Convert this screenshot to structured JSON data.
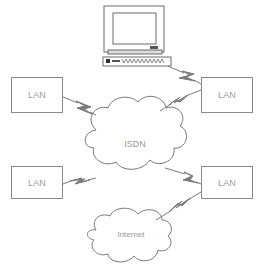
{
  "diagram": {
    "type": "network-topology",
    "colors": {
      "line": "#8a8a8a",
      "bolt": "#7a7a7a",
      "text": "#9a9a9a",
      "background": "#ffffff"
    },
    "nodes": [
      {
        "id": "computer",
        "kind": "workstation",
        "label": ""
      },
      {
        "id": "lan-top-left",
        "kind": "box",
        "label": "LAN"
      },
      {
        "id": "lan-top-right",
        "kind": "box",
        "label": "LAN"
      },
      {
        "id": "isdn",
        "kind": "cloud",
        "label": "ISDN"
      },
      {
        "id": "lan-bottom-left",
        "kind": "box",
        "label": "LAN"
      },
      {
        "id": "lan-bottom-right",
        "kind": "box",
        "label": "LAN"
      },
      {
        "id": "internet",
        "kind": "cloud",
        "label": "Internet"
      }
    ],
    "links": [
      {
        "from": "computer",
        "to": "lan-top-right",
        "style": "lightning"
      },
      {
        "from": "lan-top-left",
        "to": "isdn",
        "style": "lightning"
      },
      {
        "from": "isdn",
        "to": "lan-top-right",
        "style": "lightning"
      },
      {
        "from": "lan-bottom-left",
        "to": "isdn",
        "style": "lightning"
      },
      {
        "from": "isdn",
        "to": "lan-bottom-right",
        "style": "lightning"
      },
      {
        "from": "internet",
        "to": "lan-bottom-right",
        "style": "lightning"
      }
    ]
  }
}
